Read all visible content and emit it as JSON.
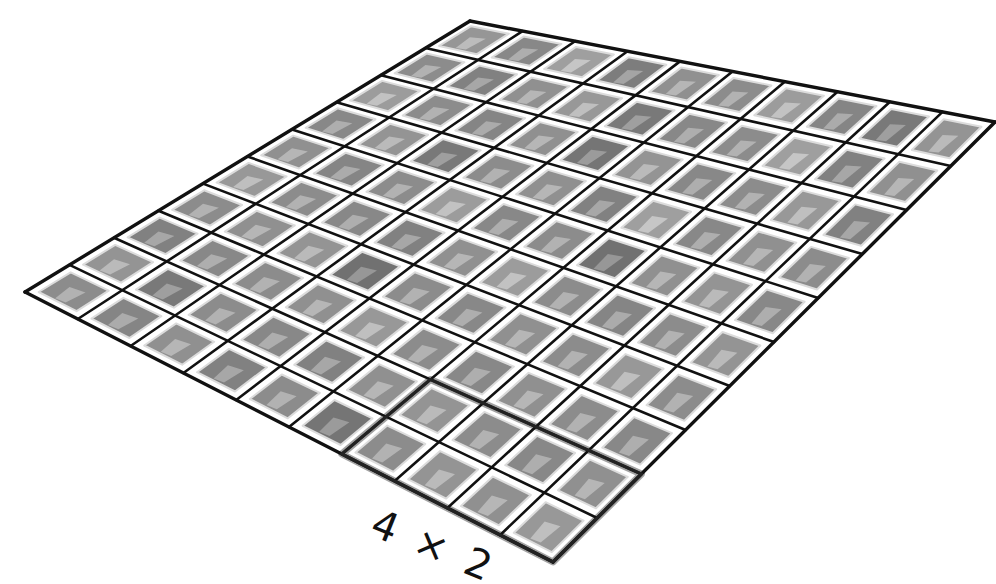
{
  "diagram": {
    "grid": {
      "rows": 10,
      "cols": 10,
      "corners": {
        "top": [
          470,
          21
        ],
        "right": [
          995,
          122
        ],
        "bottom": [
          553,
          562
        ],
        "left": [
          25,
          292
        ]
      },
      "line_color": "#111111",
      "tile_color": "#9a9a9a",
      "tile_light_color": "#c8c8c8",
      "background": "#ffffff"
    },
    "highlight": {
      "label": "4 × 2",
      "col_start": 6,
      "col_count": 4,
      "row_start": 8,
      "row_count": 2,
      "border_color": "#555555",
      "shade_color": "#8a8a8a"
    },
    "annotation": {
      "text": "4 × 2",
      "position": [
        382,
        500
      ]
    },
    "shades": [
      0.55,
      0.62,
      0.5,
      0.68,
      0.58,
      0.6,
      0.52,
      0.64,
      0.7,
      0.56,
      0.6,
      0.66,
      0.58,
      0.54,
      0.7,
      0.62,
      0.6,
      0.5,
      0.66,
      0.58,
      0.52,
      0.6,
      0.64,
      0.58,
      0.72,
      0.56,
      0.62,
      0.6,
      0.54,
      0.66,
      0.62,
      0.56,
      0.7,
      0.6,
      0.58,
      0.66,
      0.5,
      0.62,
      0.58,
      0.6,
      0.58,
      0.64,
      0.6,
      0.52,
      0.62,
      0.6,
      0.74,
      0.58,
      0.56,
      0.62,
      0.54,
      0.6,
      0.62,
      0.66,
      0.58,
      0.52,
      0.6,
      0.64,
      0.6,
      0.56,
      0.6,
      0.58,
      0.56,
      0.74,
      0.6,
      0.62,
      0.58,
      0.6,
      0.54,
      0.6,
      0.66,
      0.62,
      0.6,
      0.58,
      0.54,
      0.6,
      0.62,
      0.58,
      0.6,
      0.62,
      0.56,
      0.7,
      0.6,
      0.62,
      0.66,
      0.58,
      0.56,
      0.6,
      0.62,
      0.58,
      0.6,
      0.64,
      0.58,
      0.66,
      0.6,
      0.72,
      0.6,
      0.56,
      0.58,
      0.54
    ]
  }
}
